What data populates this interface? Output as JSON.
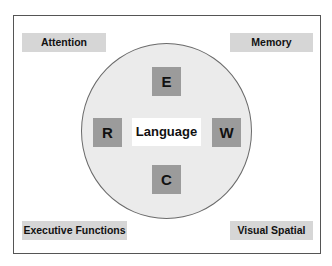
{
  "diagram": {
    "center_label": "Language",
    "inner_squares": [
      {
        "id": "top",
        "label": "E"
      },
      {
        "id": "left",
        "label": "R"
      },
      {
        "id": "right",
        "label": "W"
      },
      {
        "id": "bottom",
        "label": "C"
      }
    ],
    "corner_labels": {
      "top_left": "Attention",
      "top_right": "Memory",
      "bottom_left": "Executive Functions",
      "bottom_right": "Visual Spatial"
    },
    "colors": {
      "frame_border": "#555555",
      "circle_fill": "#ebebeb",
      "square_fill": "#9b9b9b",
      "tag_fill": "#d6d6d6",
      "text": "#111111"
    }
  }
}
